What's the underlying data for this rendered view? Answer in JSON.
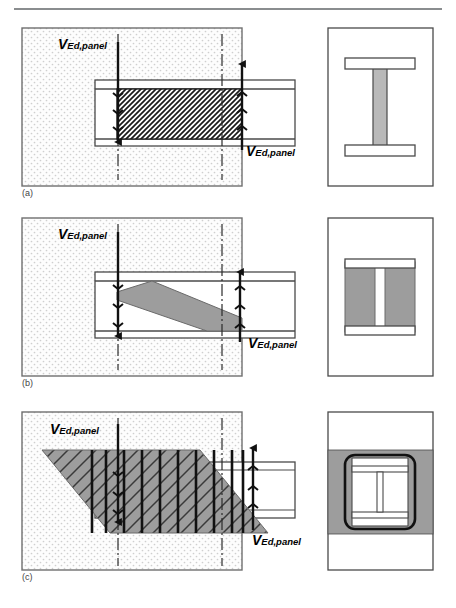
{
  "figure": {
    "title_rule": true,
    "load_label": "V",
    "load_subscript": "Ed,panel",
    "panels": [
      {
        "id": "a",
        "caption": "(a)",
        "description": "Bare steel beam-to-column joint panel in shear, hatched steel web panel",
        "left_view": {
          "concrete_block": {
            "x": 22,
            "y": 28,
            "w": 220,
            "h": 158,
            "fill": "#fdfdfd",
            "pattern": "concrete-stipple"
          },
          "beam_flanges": {
            "x": 95,
            "y": 80,
            "w": 200,
            "h": 66
          },
          "shear_panel": {
            "x": 117,
            "y": 89,
            "w": 125,
            "h": 50,
            "pattern": "diagonal-hatch-45"
          },
          "center_lines_x": [
            118,
            222
          ],
          "arrow_down_x": 118,
          "arrow_up_x": 242,
          "label_top": {
            "x": 58,
            "y": 42
          },
          "label_bottom": {
            "x": 246,
            "y": 148
          }
        },
        "section_view": {
          "frame": {
            "x": 328,
            "y": 28,
            "w": 105,
            "h": 158
          },
          "type": "bare-steel-I-section",
          "web_fill": "#b9b9b9",
          "flange_fill": "#ffffff"
        }
      },
      {
        "id": "b",
        "caption": "(b)",
        "description": "Partially encased composite joint, diagonal concrete strut band in panel",
        "left_view": {
          "concrete_block": {
            "x": 22,
            "y": 218,
            "w": 220,
            "h": 158,
            "fill": "#fdfdfd",
            "pattern": "concrete-stipple"
          },
          "beam_flanges": {
            "x": 95,
            "y": 272,
            "w": 200,
            "h": 66
          },
          "strut_fill": "#9d9d9d",
          "center_lines_x": [
            118,
            222
          ],
          "arrow_down_x": 118,
          "arrow_up_x": 240,
          "label_top": {
            "x": 58,
            "y": 232
          },
          "label_bottom": {
            "x": 248,
            "y": 340
          }
        },
        "section_view": {
          "frame": {
            "x": 328,
            "y": 218,
            "w": 105,
            "h": 158
          },
          "type": "partially-encased-I-section",
          "encasement_fill": "#9d9d9d",
          "web_fill": "#ffffff",
          "flange_fill": "#ffffff"
        }
      },
      {
        "id": "c",
        "caption": "(c)",
        "description": "Fully encased composite joint, inclined concrete strut with vertical stirrup reinforcement bars",
        "left_view": {
          "concrete_block": {
            "x": 22,
            "y": 412,
            "w": 220,
            "h": 158,
            "fill": "#fdfdfd",
            "pattern": "concrete-stipple"
          },
          "beam_flanges": {
            "x": 95,
            "y": 462,
            "w": 200,
            "h": 56
          },
          "strut_fill": "#9d9d9d",
          "strut_hatch": "diagonal-hatch-45",
          "stirrup_bar_count": 12,
          "center_lines_x": [
            118,
            222
          ],
          "arrow_down_x": 118,
          "arrow_up_x": 243,
          "label_top": {
            "x": 50,
            "y": 428
          },
          "label_bottom": {
            "x": 252,
            "y": 538
          }
        },
        "section_view": {
          "frame": {
            "x": 328,
            "y": 412,
            "w": 105,
            "h": 158
          },
          "type": "fully-encased-I-section-with-stirrup",
          "encasement_fill": "#9d9d9d",
          "stirrup": "rounded-rectangle",
          "web_fill": "#ffffff",
          "flange_fill": "#ffffff"
        }
      }
    ]
  }
}
